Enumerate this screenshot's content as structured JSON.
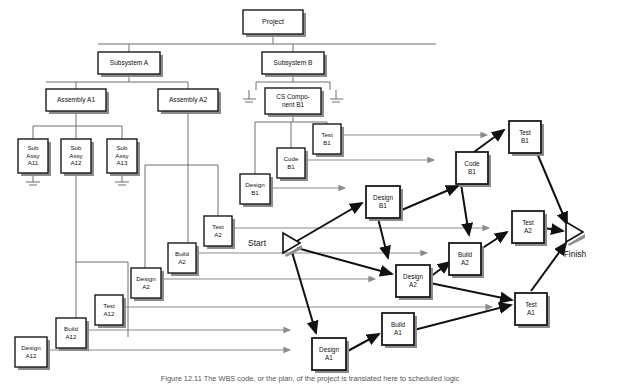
{
  "figure": {
    "caption": "Figure 12.11   The WBS code, or the plan, of the project is translated here to scheduled logic",
    "background": "#ffffff",
    "box_fill": "#ffffff",
    "box_stroke": "#1a1a1a",
    "shadow_color": "#8c8c8c",
    "wbs_line_color": "#6e6e6e",
    "flow_line_color": "#8a8a8a",
    "network_line_color": "#111111",
    "text_color": "#111111"
  },
  "milestones": {
    "start": {
      "label": "Start",
      "x": 286,
      "y": 244
    },
    "finish": {
      "label": "Finish",
      "x": 574,
      "y": 242
    }
  },
  "wbs": {
    "title": "Work Breakdown Structure",
    "nodes": [
      {
        "id": "project",
        "lines": [
          "Project"
        ],
        "x": 243,
        "y": 10,
        "w": 60,
        "h": 24,
        "font": 7.0
      },
      {
        "id": "subsys_a",
        "lines": [
          "Subsystem A"
        ],
        "x": 98,
        "y": 52,
        "w": 62,
        "h": 22,
        "font": 6.6
      },
      {
        "id": "subsys_b",
        "lines": [
          "Subsystem B"
        ],
        "x": 262,
        "y": 52,
        "w": 62,
        "h": 22,
        "font": 6.6
      },
      {
        "id": "asm_a1",
        "lines": [
          "Assembly A1"
        ],
        "x": 46,
        "y": 89,
        "w": 60,
        "h": 22,
        "font": 6.6
      },
      {
        "id": "asm_a2",
        "lines": [
          "Assembly A2"
        ],
        "x": 158,
        "y": 89,
        "w": 60,
        "h": 22,
        "font": 6.6
      },
      {
        "id": "cs_comp_b1",
        "lines": [
          "CS Compo-",
          "nent B1"
        ],
        "x": 265,
        "y": 88,
        "w": 56,
        "h": 26,
        "font": 6.4
      },
      {
        "id": "sub_a11",
        "lines": [
          "Sub",
          "Assy",
          "A11"
        ],
        "x": 18,
        "y": 139,
        "w": 30,
        "h": 34,
        "font": 6.2
      },
      {
        "id": "sub_a12",
        "lines": [
          "Sub",
          "Assy",
          "A12"
        ],
        "x": 61,
        "y": 139,
        "w": 30,
        "h": 34,
        "font": 6.2
      },
      {
        "id": "sub_a13",
        "lines": [
          "Sub",
          "Assy",
          "A13"
        ],
        "x": 107,
        "y": 139,
        "w": 30,
        "h": 34,
        "font": 6.2
      }
    ]
  },
  "activities_source": {
    "description": "Activity boxes hanging off the WBS, feeding the network",
    "nodes": [
      {
        "id": "test_b1_src",
        "lines": [
          "Test",
          "B1"
        ],
        "x": 313,
        "y": 124,
        "w": 28,
        "h": 30,
        "font": 6.2
      },
      {
        "id": "code_b1_src",
        "lines": [
          "Code",
          "B1"
        ],
        "x": 277,
        "y": 148,
        "w": 28,
        "h": 30,
        "font": 6.2
      },
      {
        "id": "design_b1_src",
        "lines": [
          "Design",
          "B1"
        ],
        "x": 240,
        "y": 174,
        "w": 30,
        "h": 30,
        "font": 6.2
      },
      {
        "id": "test_a2_src",
        "lines": [
          "Test",
          "A2"
        ],
        "x": 204,
        "y": 216,
        "w": 28,
        "h": 30,
        "font": 6.2
      },
      {
        "id": "build_a2_src",
        "lines": [
          "Build",
          "A2"
        ],
        "x": 168,
        "y": 243,
        "w": 28,
        "h": 30,
        "font": 6.2
      },
      {
        "id": "design_a2_src",
        "lines": [
          "Design",
          "A2"
        ],
        "x": 131,
        "y": 268,
        "w": 30,
        "h": 30,
        "font": 6.2
      },
      {
        "id": "test_a12_src",
        "lines": [
          "Test",
          "A12"
        ],
        "x": 95,
        "y": 295,
        "w": 28,
        "h": 30,
        "font": 6.2
      },
      {
        "id": "build_a12_src",
        "lines": [
          "Build",
          "A12"
        ],
        "x": 56,
        "y": 318,
        "w": 30,
        "h": 30,
        "font": 6.2
      },
      {
        "id": "design_a12_src",
        "lines": [
          "Design",
          "A12"
        ],
        "x": 15,
        "y": 337,
        "w": 32,
        "h": 30,
        "font": 6.2
      }
    ]
  },
  "network": {
    "description": "Precedence network on the right built from the WBS activities",
    "nodes": [
      {
        "id": "test_b1_net",
        "lines": [
          "Test",
          "B1"
        ],
        "x": 509,
        "y": 121,
        "w": 32,
        "h": 32,
        "font": 6.4
      },
      {
        "id": "code_b1_net",
        "lines": [
          "Code",
          "B1"
        ],
        "x": 456,
        "y": 152,
        "w": 32,
        "h": 32,
        "font": 6.4
      },
      {
        "id": "design_b1_net",
        "lines": [
          "Design",
          "B1"
        ],
        "x": 366,
        "y": 186,
        "w": 34,
        "h": 32,
        "font": 6.4
      },
      {
        "id": "test_a2_net",
        "lines": [
          "Test",
          "A2"
        ],
        "x": 512,
        "y": 211,
        "w": 32,
        "h": 32,
        "font": 6.4
      },
      {
        "id": "build_a2_net",
        "lines": [
          "Build",
          "A2"
        ],
        "x": 449,
        "y": 243,
        "w": 32,
        "h": 32,
        "font": 6.4
      },
      {
        "id": "design_a2_net",
        "lines": [
          "Design",
          "A2"
        ],
        "x": 396,
        "y": 265,
        "w": 34,
        "h": 32,
        "font": 6.4
      },
      {
        "id": "test_a1_net",
        "lines": [
          "Test",
          "A1"
        ],
        "x": 515,
        "y": 293,
        "w": 32,
        "h": 32,
        "font": 6.4
      },
      {
        "id": "build_a1_net",
        "lines": [
          "Build",
          "A1"
        ],
        "x": 382,
        "y": 313,
        "w": 32,
        "h": 32,
        "font": 6.4
      },
      {
        "id": "design_a1_net",
        "lines": [
          "Design",
          "A1"
        ],
        "x": 312,
        "y": 338,
        "w": 34,
        "h": 32,
        "font": 6.4
      }
    ],
    "edges": [
      {
        "from": "start",
        "to": "design_b1_net"
      },
      {
        "from": "start",
        "to": "design_a2_net"
      },
      {
        "from": "start",
        "to": "design_a1_net"
      },
      {
        "from": "design_b1_net",
        "to": "code_b1_net"
      },
      {
        "from": "design_b1_net",
        "to": "design_a2_net"
      },
      {
        "from": "code_b1_net",
        "to": "test_b1_net"
      },
      {
        "from": "code_b1_net",
        "to": "build_a2_net"
      },
      {
        "from": "design_a2_net",
        "to": "build_a2_net"
      },
      {
        "from": "design_a2_net",
        "to": "test_a1_net"
      },
      {
        "from": "build_a2_net",
        "to": "test_a2_net"
      },
      {
        "from": "design_a1_net",
        "to": "build_a1_net"
      },
      {
        "from": "build_a1_net",
        "to": "test_a1_net"
      },
      {
        "from": "test_b1_net",
        "to": "finish"
      },
      {
        "from": "test_a2_net",
        "to": "finish"
      },
      {
        "from": "test_a1_net",
        "to": "finish"
      }
    ]
  },
  "transfer_arrows": {
    "description": "Light grey arrows carrying each WBS activity box into the network",
    "count": 9
  }
}
